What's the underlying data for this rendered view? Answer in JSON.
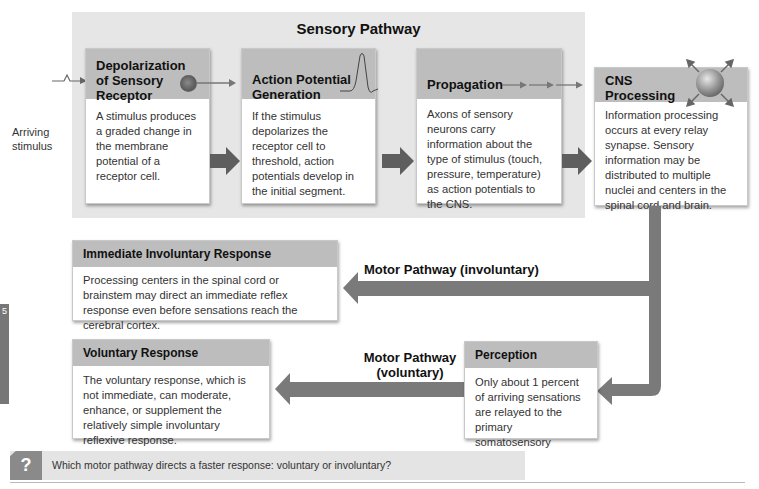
{
  "diagram": {
    "sensory_pathway": {
      "title": "Sensory Pathway",
      "input_label_line1": "Arriving",
      "input_label_line2": "stimulus",
      "steps": [
        {
          "title_lines": [
            "Depolarization",
            "of Sensory",
            "Receptor"
          ],
          "body": "A stimulus produces a graded change in the membrane potential of a receptor cell.",
          "icon": "receptor-cell-icon"
        },
        {
          "title_lines": [
            "Action Potential",
            "Generation"
          ],
          "body": "If the stimulus depolarizes the receptor cell to threshold, action potentials develop in the initial segment.",
          "icon": "action-potential-spike-icon"
        },
        {
          "title_lines": [
            "Propagation"
          ],
          "body": "Axons of sensory neurons carry information about the type of stimulus (touch, pressure, temperature) as action potentials to the CNS.",
          "icon": "dashed-arrow-icon"
        }
      ]
    },
    "cns_processing": {
      "title_lines": [
        "CNS",
        "Processing"
      ],
      "body": "Information processing occurs at every relay synapse. Sensory information may be distributed to multiple nuclei and centers in the spinal cord and brain.",
      "icon": "sphere-radiating-arrows-icon"
    },
    "immediate_response": {
      "title": "Immediate Involuntary Response",
      "body": "Processing centers in the spinal cord or brainstem may direct an immediate reflex response even before sensations reach the cerebral cortex."
    },
    "voluntary_response": {
      "title": "Voluntary Response",
      "body": "The voluntary response, which is not immediate, can moderate, enhance, or supplement the relatively simple involuntary reflexive response."
    },
    "perception": {
      "title": "Perception",
      "body": "Only about 1 percent of arriving sensations are relayed to the primary somatosensory cortex."
    },
    "motor_pathways": {
      "involuntary": "Motor Pathway (involuntary)",
      "voluntary_line1": "Motor Pathway",
      "voluntary_line2": "(voluntary)"
    },
    "side_tab_number": "5"
  },
  "question": {
    "icon": "?",
    "text": "Which motor pathway directs a faster response: voluntary or involuntary?"
  },
  "colors": {
    "sensory_bg": "#e6e6e6",
    "header_gray": "#bdbdbd",
    "arrow_gray": "#7a7a7a",
    "dark_arrow": "#5e5e5e"
  }
}
